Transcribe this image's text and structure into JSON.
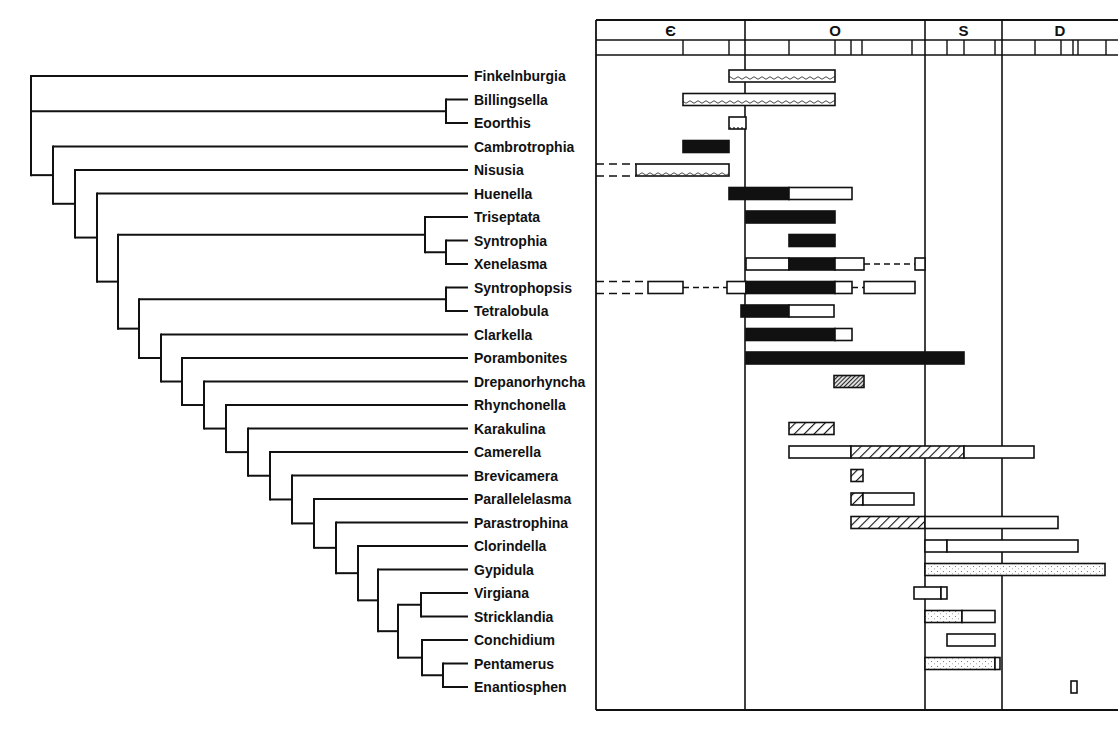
{
  "figure": {
    "type": "cladogram-with-stratigraphic-ranges",
    "periods": [
      {
        "symbol": "Є",
        "name": "Cambrian",
        "x0": 596,
        "x1": 745,
        "ticks": [
          683,
          729
        ]
      },
      {
        "symbol": "O",
        "name": "Ordovician",
        "x0": 745,
        "x1": 925,
        "ticks": [
          789,
          835,
          851,
          862,
          912
        ]
      },
      {
        "symbol": "S",
        "name": "Silurian",
        "x0": 925,
        "x1": 1002,
        "ticks": [
          947,
          964,
          995
        ]
      },
      {
        "symbol": "D",
        "name": "Devonian",
        "x0": 1002,
        "x1": 1118,
        "ticks": [
          1035,
          1061,
          1073,
          1078,
          1106
        ]
      }
    ],
    "pattern_legend": {
      "solid": "black filled",
      "open": "white open box",
      "wavy": "wavy line fill",
      "hatch": "diagonal hatch",
      "dense-hatch": "dense dark hatch",
      "dots": "stippled",
      "dashed": "dashed extension"
    },
    "taxa": [
      {
        "name": "Finkelnburgia",
        "segments": [
          {
            "x0": 729,
            "x1": 835,
            "fill": "wavy"
          }
        ]
      },
      {
        "name": "Billingsella",
        "segments": [
          {
            "x0": 683,
            "x1": 835,
            "fill": "wavy"
          }
        ]
      },
      {
        "name": "Eoorthis",
        "segments": [
          {
            "x0": 729,
            "x1": 746,
            "fill": "open-dots"
          }
        ]
      },
      {
        "name": "Cambrotrophia",
        "segments": [
          {
            "x0": 683,
            "x1": 729,
            "fill": "solid"
          }
        ]
      },
      {
        "name": "Nisusia",
        "segments": [
          {
            "x0": 596,
            "x1": 636,
            "fill": "dashed-double"
          },
          {
            "x0": 636,
            "x1": 729,
            "fill": "wavy"
          }
        ]
      },
      {
        "name": "Huenella",
        "segments": [
          {
            "x0": 729,
            "x1": 789,
            "fill": "solid"
          },
          {
            "x0": 789,
            "x1": 852,
            "fill": "open"
          }
        ]
      },
      {
        "name": "Triseptata",
        "segments": [
          {
            "x0": 746,
            "x1": 835,
            "fill": "solid"
          }
        ]
      },
      {
        "name": "Syntrophia",
        "segments": [
          {
            "x0": 789,
            "x1": 835,
            "fill": "solid"
          }
        ]
      },
      {
        "name": "Xenelasma",
        "segments": [
          {
            "x0": 746,
            "x1": 789,
            "fill": "open"
          },
          {
            "x0": 789,
            "x1": 835,
            "fill": "solid"
          },
          {
            "x0": 835,
            "x1": 864,
            "fill": "open"
          },
          {
            "x0": 864,
            "x1": 915,
            "fill": "dashed-line"
          },
          {
            "x0": 915,
            "x1": 925,
            "fill": "open"
          }
        ]
      },
      {
        "name": "Syntrophopsis",
        "segments": [
          {
            "x0": 596,
            "x1": 648,
            "fill": "dashed-double"
          },
          {
            "x0": 648,
            "x1": 683,
            "fill": "open"
          },
          {
            "x0": 683,
            "x1": 727,
            "fill": "dashed-line"
          },
          {
            "x0": 727,
            "x1": 746,
            "fill": "open"
          },
          {
            "x0": 746,
            "x1": 835,
            "fill": "solid"
          },
          {
            "x0": 835,
            "x1": 852,
            "fill": "open"
          },
          {
            "x0": 852,
            "x1": 864,
            "fill": "dashed-line"
          },
          {
            "x0": 864,
            "x1": 915,
            "fill": "open"
          }
        ]
      },
      {
        "name": "Tetralobula",
        "segments": [
          {
            "x0": 741,
            "x1": 789,
            "fill": "solid"
          },
          {
            "x0": 789,
            "x1": 834,
            "fill": "open"
          }
        ]
      },
      {
        "name": "Clarkella",
        "segments": [
          {
            "x0": 746,
            "x1": 835,
            "fill": "solid"
          },
          {
            "x0": 835,
            "x1": 852,
            "fill": "open"
          }
        ]
      },
      {
        "name": "Porambonites",
        "segments": [
          {
            "x0": 746,
            "x1": 964,
            "fill": "solid"
          }
        ]
      },
      {
        "name": "Drepanorhyncha",
        "segments": [
          {
            "x0": 834,
            "x1": 864,
            "fill": "dense-hatch"
          }
        ]
      },
      {
        "name": "Rhynchonella",
        "segments": []
      },
      {
        "name": "Karakulina",
        "segments": [
          {
            "x0": 789,
            "x1": 834,
            "fill": "hatch"
          }
        ]
      },
      {
        "name": "Camerella",
        "segments": [
          {
            "x0": 789,
            "x1": 851,
            "fill": "open"
          },
          {
            "x0": 851,
            "x1": 964,
            "fill": "hatch"
          },
          {
            "x0": 964,
            "x1": 1034,
            "fill": "open"
          }
        ]
      },
      {
        "name": "Brevicamera",
        "segments": [
          {
            "x0": 851,
            "x1": 863,
            "fill": "hatch"
          }
        ]
      },
      {
        "name": "Parallelelasma",
        "segments": [
          {
            "x0": 851,
            "x1": 863,
            "fill": "hatch"
          },
          {
            "x0": 863,
            "x1": 914,
            "fill": "open"
          }
        ]
      },
      {
        "name": "Parastrophina",
        "segments": [
          {
            "x0": 851,
            "x1": 925,
            "fill": "hatch"
          },
          {
            "x0": 925,
            "x1": 1058,
            "fill": "open"
          }
        ]
      },
      {
        "name": "Clorindella",
        "segments": [
          {
            "x0": 925,
            "x1": 947,
            "fill": "open"
          },
          {
            "x0": 947,
            "x1": 1078,
            "fill": "open"
          }
        ]
      },
      {
        "name": "Gypidula",
        "segments": [
          {
            "x0": 925,
            "x1": 1105,
            "fill": "dots"
          }
        ]
      },
      {
        "name": "Virgiana",
        "segments": [
          {
            "x0": 914,
            "x1": 941,
            "fill": "open"
          },
          {
            "x0": 941,
            "x1": 947,
            "fill": "open"
          }
        ]
      },
      {
        "name": "Stricklandia",
        "segments": [
          {
            "x0": 925,
            "x1": 962,
            "fill": "dots"
          },
          {
            "x0": 962,
            "x1": 995,
            "fill": "open"
          }
        ]
      },
      {
        "name": "Conchidium",
        "segments": [
          {
            "x0": 947,
            "x1": 995,
            "fill": "open"
          }
        ]
      },
      {
        "name": "Pentamerus",
        "segments": [
          {
            "x0": 925,
            "x1": 995,
            "fill": "dots"
          },
          {
            "x0": 995,
            "x1": 1000,
            "fill": "open"
          }
        ]
      },
      {
        "name": "Enantiosphen",
        "segments": [
          {
            "x0": 1071,
            "x1": 1077,
            "fill": "open"
          }
        ]
      }
    ],
    "tree": {
      "comment": "Each node: x of vertical bar; children are row indices (leaves) or nested nodes",
      "root": {
        "x": 31,
        "children": [
          {
            "leaf": 0
          },
          {
            "x": 446,
            "children": [
              {
                "leaf": 1
              },
              {
                "leaf": 2
              }
            ]
          },
          {
            "x": 53,
            "children": [
              {
                "leaf": 3
              },
              {
                "x": 75,
                "children": [
                  {
                    "leaf": 4
                  },
                  {
                    "x": 97,
                    "children": [
                      {
                        "leaf": 5
                      },
                      {
                        "x": 118,
                        "children": [
                          {
                            "x": 425,
                            "children": [
                              {
                                "leaf": 6
                              },
                              {
                                "x": 446,
                                "children": [
                                  {
                                    "leaf": 7
                                  },
                                  {
                                    "leaf": 8
                                  }
                                ]
                              }
                            ]
                          },
                          {
                            "x": 139,
                            "children": [
                              {
                                "x": 446,
                                "children": [
                                  {
                                    "leaf": 9
                                  },
                                  {
                                    "leaf": 10
                                  }
                                ]
                              },
                              {
                                "x": 161,
                                "children": [
                                  {
                                    "leaf": 11
                                  },
                                  {
                                    "x": 182,
                                    "children": [
                                      {
                                        "leaf": 12
                                      },
                                      {
                                        "x": 204,
                                        "children": [
                                          {
                                            "leaf": 13
                                          },
                                          {
                                            "x": 226,
                                            "children": [
                                              {
                                                "leaf": 14
                                              },
                                              {
                                                "x": 248,
                                                "children": [
                                                  {
                                                    "leaf": 15
                                                  },
                                                  {
                                                    "x": 270,
                                                    "children": [
                                                      {
                                                        "leaf": 16
                                                      },
                                                      {
                                                        "x": 292,
                                                        "children": [
                                                          {
                                                            "leaf": 17
                                                          },
                                                          {
                                                            "x": 314,
                                                            "children": [
                                                              {
                                                                "leaf": 18
                                                              },
                                                              {
                                                                "x": 336,
                                                                "children": [
                                                                  {
                                                                    "leaf": 19
                                                                  },
                                                                  {
                                                                    "x": 358,
                                                                    "children": [
                                                                      {
                                                                        "leaf": 20
                                                                      },
                                                                      {
                                                                        "x": 378,
                                                                        "children": [
                                                                          {
                                                                            "leaf": 21
                                                                          },
                                                                          {
                                                                            "x": 398,
                                                                            "children": [
                                                                              {
                                                                                "x": 421,
                                                                                "children": [
                                                                                  {
                                                                                    "leaf": 22
                                                                                  },
                                                                                  {
                                                                                    "leaf": 23
                                                                                  }
                                                                                ]
                                                                              },
                                                                              {
                                                                                "x": 422,
                                                                                "children": [
                                                                                  {
                                                                                    "leaf": 24
                                                                                  },
                                                                                  {
                                                                                    "x": 443,
                                                                                    "children": [
                                                                                      {
                                                                                        "leaf": 25
                                                                                      },
                                                                                      {
                                                                                        "leaf": 26
                                                                                      }
                                                                                    ]
                                                                                  }
                                                                                ]
                                                                              }
                                                                            ]
                                                                          }
                                                                        ]
                                                                      }
                                                                    ]
                                                                  }
                                                                ]
                                                              }
                                                            ]
                                                          }
                                                        ]
                                                      }
                                                    ]
                                                  }
                                                ]
                                              }
                                            ]
                                          }
                                        ]
                                      }
                                    ]
                                  }
                                ]
                              }
                            ]
                          }
                        ]
                      }
                    ]
                  }
                ]
              }
            ]
          }
        ]
      }
    }
  }
}
